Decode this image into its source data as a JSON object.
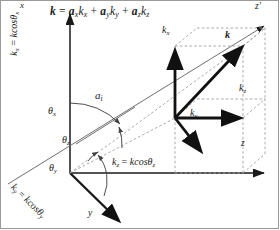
{
  "figure": {
    "title_equation": "k = a_x k_x + a_y k_y + a_z k_z",
    "background_color": "#ffffff",
    "line_color": "#1a1a1a",
    "dashed_color": "#9b9b9b"
  },
  "equation": {
    "lhs": "k",
    "eq": " = ",
    "t1_coef": "a",
    "t1_coef_sub": "x",
    "t1_var": "k",
    "t1_var_sub": "x",
    "plus1": " + ",
    "t2_coef": "a",
    "t2_coef_sub": "y",
    "t2_var": "k",
    "t2_var_sub": "y",
    "plus2": " + ",
    "t3_coef": "a",
    "t3_coef_sub": "z",
    "t3_var": "k",
    "t3_var_sub": "z"
  },
  "axes": {
    "x_label": "x",
    "y_label": "y",
    "z_label": "z",
    "z_prime_label": "z",
    "z_prime_sup": "'"
  },
  "axis_component_labels": {
    "x": {
      "lhs": "k",
      "lhs_sub": "x",
      "rhs": "kcos",
      "theta": "θ",
      "theta_sub": "x"
    },
    "y": {
      "lhs": "k",
      "lhs_sub": "y",
      "rhs": "kcos",
      "theta": "θ",
      "theta_sub": "y"
    },
    "z": {
      "lhs": "k",
      "lhs_sub": "z",
      "rhs": "kcos",
      "theta": "θ",
      "theta_sub": "z"
    }
  },
  "vectors": {
    "incident_ray": {
      "label": "a",
      "sub": "i"
    },
    "k_vector": {
      "label": "k"
    },
    "k_x_component": {
      "label": "k",
      "sub": "x"
    },
    "k_y_component": {
      "label": "k",
      "sub": "y"
    },
    "k_z_component": {
      "label": "k",
      "sub": "z"
    }
  },
  "angles": {
    "theta_x": {
      "glyph": "θ",
      "sub": "x"
    },
    "theta_y": {
      "glyph": "θ",
      "sub": "y"
    },
    "theta_z": {
      "glyph": "θ",
      "sub": "z"
    }
  }
}
